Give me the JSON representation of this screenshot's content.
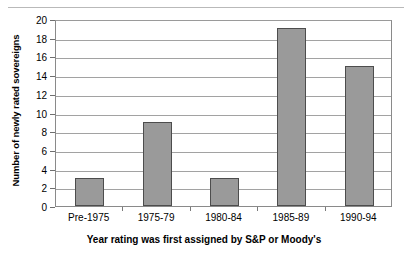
{
  "chart_data": {
    "type": "bar",
    "title": "",
    "subtitle": "",
    "categories": [
      "Pre-1975",
      "1975-79",
      "1980-84",
      "1985-89",
      "1990-94"
    ],
    "values": [
      3,
      9,
      3,
      19,
      15
    ],
    "series": [
      {
        "name": "Number of newly rated sovereigns",
        "values": [
          3,
          9,
          3,
          19,
          15
        ]
      }
    ],
    "xlabel": "Year rating was first assigned by S&P or Moody's",
    "ylabel": "Number of newly rated sovereigns",
    "ylim": [
      0,
      20
    ],
    "ytick_step": 2,
    "yticks": [
      0,
      2,
      4,
      6,
      8,
      10,
      12,
      14,
      16,
      18,
      20
    ],
    "ytick_labels": [
      "0",
      "2",
      "4",
      "6",
      "8",
      "10",
      "12",
      "14",
      "16",
      "18",
      "20"
    ],
    "grid": "horizontal",
    "legend": "none",
    "bar_fill_color": "#9a9a9a",
    "bar_border_color": "#4d4d4d",
    "gridline_color": "#a2a2a2",
    "plot_border_color": "#8a8a8a",
    "background_color": "#ffffff",
    "text_color": "#000000",
    "annotations": []
  }
}
